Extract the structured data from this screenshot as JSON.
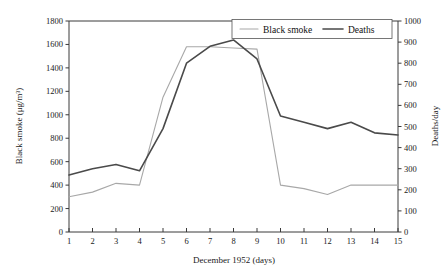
{
  "chart_data": {
    "type": "line",
    "title": "",
    "xlabel": "December 1952 (days)",
    "x": [
      1,
      2,
      3,
      4,
      5,
      6,
      7,
      8,
      9,
      10,
      11,
      12,
      13,
      14,
      15
    ],
    "xtick_labels": [
      "1",
      "2",
      "3",
      "4",
      "5",
      "6",
      "7",
      "8",
      "9",
      "10",
      "11",
      "12",
      "13",
      "14",
      "15"
    ],
    "xlim": [
      1,
      15
    ],
    "grid": false,
    "legend_position": "top-right",
    "axes": {
      "left": {
        "label": "Black smoke (μg/m³)",
        "lim": [
          0,
          1800
        ],
        "ticks": [
          0,
          200,
          400,
          600,
          800,
          1000,
          1200,
          1400,
          1600,
          1800
        ],
        "tick_labels": [
          "0",
          "200",
          "400",
          "600",
          "800",
          "1000",
          "1200",
          "1400",
          "1600",
          "1800"
        ]
      },
      "right": {
        "label": "Deaths/day",
        "lim": [
          0,
          1000
        ],
        "ticks": [
          0,
          100,
          200,
          300,
          400,
          500,
          600,
          700,
          800,
          900,
          1000
        ],
        "tick_labels": [
          "0",
          "100",
          "200",
          "300",
          "400",
          "500",
          "600",
          "700",
          "800",
          "900",
          "1000"
        ]
      }
    },
    "series": [
      {
        "name": "Black smoke",
        "axis": "left",
        "color": "#a8a8a8",
        "width": 1.1,
        "values": [
          300,
          340,
          415,
          400,
          1150,
          1580,
          1580,
          1570,
          1560,
          400,
          370,
          320,
          400,
          400,
          400
        ]
      },
      {
        "name": "Deaths",
        "axis": "right",
        "color": "#4a4a4a",
        "width": 1.6,
        "values": [
          270,
          300,
          320,
          290,
          490,
          800,
          880,
          910,
          820,
          550,
          520,
          490,
          520,
          470,
          460
        ]
      }
    ],
    "legend": [
      {
        "label": "Black smoke",
        "color": "#a8a8a8",
        "width": 1.1
      },
      {
        "label": "Deaths",
        "color": "#4a4a4a",
        "width": 1.6
      }
    ]
  }
}
